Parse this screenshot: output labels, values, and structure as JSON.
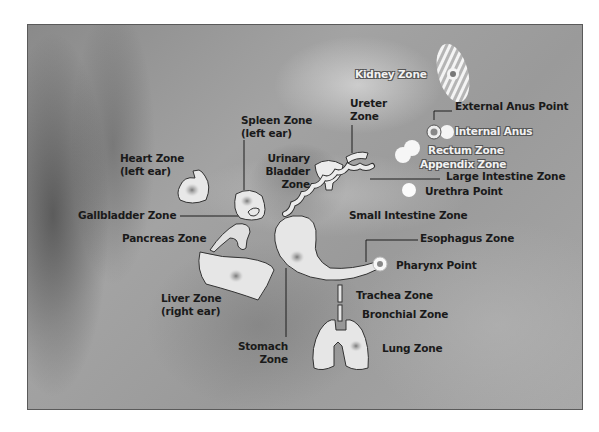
{
  "figure": {
    "type": "ear acupuncture / auriculotherapy zone diagram",
    "background": "grayscale close-up photograph of the concha of the ear",
    "colors": {
      "zone_fill": "#e6e6e6",
      "zone_outline": "#2b2b2b",
      "label_text": "#1a1a1a",
      "outlined_label_text": "#f2f2f2",
      "frame_border": "#5a5a5a"
    }
  },
  "labels": {
    "kidney": "Kidney Zone",
    "external_anus": "External Anus Point",
    "internal_anus": "Internal Anus",
    "ureter_1": "Ureter",
    "ureter_2": "Zone",
    "spleen_1": "Spleen Zone",
    "spleen_2": "(left ear)",
    "heart_1": "Heart Zone",
    "heart_2": "(left ear)",
    "bladder_1": "Urinary",
    "bladder_2": "Bladder",
    "bladder_3": "Zone",
    "rectum": "Rectum Zone",
    "appendix": "Appendix Zone",
    "large_intestine": "Large Intestine Zone",
    "urethra": "Urethra Point",
    "gallbladder": "Gallbladder Zone",
    "small_intestine": "Small Intestine Zone",
    "pancreas": "Pancreas Zone",
    "esophagus": "Esophagus Zone",
    "pharynx": "Pharynx Point",
    "liver_1": "Liver Zone",
    "liver_2": "(right ear)",
    "trachea": "Trachea Zone",
    "bronchial": "Bronchial Zone",
    "stomach_1": "Stomach",
    "stomach_2": "Zone",
    "lung": "Lung Zone"
  },
  "zones": [
    {
      "name": "Kidney Zone",
      "shape": "hatched ellipse",
      "marker": "center dot"
    },
    {
      "name": "External Anus Point",
      "shape": "point"
    },
    {
      "name": "Internal Anus",
      "shape": "starburst"
    },
    {
      "name": "Rectum Zone",
      "shape": "starburst"
    },
    {
      "name": "Appendix Zone",
      "shape": "starburst"
    },
    {
      "name": "Urethra Point",
      "shape": "white circle"
    },
    {
      "name": "Ureter Zone",
      "shape": "curved band"
    },
    {
      "name": "Urinary Bladder Zone",
      "shape": "bladder"
    },
    {
      "name": "Large Intestine Zone",
      "shape": "coil"
    },
    {
      "name": "Small Intestine Zone",
      "shape": "coil"
    },
    {
      "name": "Spleen Zone (left ear)",
      "shape": "blob",
      "marker": "center dot"
    },
    {
      "name": "Heart Zone (left ear)",
      "shape": "heart",
      "marker": "center dot"
    },
    {
      "name": "Gallbladder Zone",
      "shape": "small blob"
    },
    {
      "name": "Pancreas Zone",
      "shape": "blob"
    },
    {
      "name": "Liver Zone (right ear)",
      "shape": "blob",
      "marker": "center dot"
    },
    {
      "name": "Stomach Zone",
      "shape": "J-shape",
      "marker": "center dot"
    },
    {
      "name": "Esophagus Zone",
      "shape": "tube"
    },
    {
      "name": "Pharynx Point",
      "shape": "point"
    },
    {
      "name": "Trachea Zone",
      "shape": "tube segment"
    },
    {
      "name": "Bronchial Zone",
      "shape": "tube segment"
    },
    {
      "name": "Lung Zone",
      "shape": "lungs",
      "marker": "center dot"
    }
  ]
}
